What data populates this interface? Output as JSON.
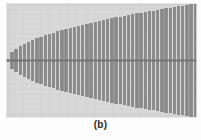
{
  "figure": {
    "caption": "(b)",
    "panel": {
      "width": 191,
      "height": 115,
      "background_color": "#d9d9d9",
      "stripe_dark_color": "#8a8a8a",
      "stripe_light_color": "#c9c9c9",
      "centerline_color": "#6e6e6e"
    }
  },
  "chart_data": {
    "type": "bar",
    "title": "",
    "subtitle": "",
    "xlabel": "",
    "ylabel": "",
    "grid": false,
    "legend": null,
    "annotations": [
      {
        "kind": "centerline",
        "orientation": "horizontal",
        "y": 0,
        "color": "#6e6e6e",
        "thickness_px": 2
      }
    ],
    "envelope": {
      "shape": "parabolic",
      "symmetric_about_y": 0,
      "apex_x": 0.0,
      "apex_half_height": 0.02,
      "max_half_height": 1.0
    },
    "xlim": [
      0,
      1
    ],
    "ylim": [
      -1,
      1
    ],
    "bar_count": 46,
    "bar_width_fraction": 0.52,
    "categories": [
      0.0,
      0.0222,
      0.0444,
      0.0667,
      0.0889,
      0.1111,
      0.1333,
      0.1556,
      0.1778,
      0.2,
      0.2222,
      0.2444,
      0.2667,
      0.2889,
      0.3111,
      0.3333,
      0.3556,
      0.3778,
      0.4,
      0.4222,
      0.4444,
      0.4667,
      0.4889,
      0.5111,
      0.5333,
      0.5556,
      0.5778,
      0.6,
      0.6222,
      0.6444,
      0.6667,
      0.6889,
      0.7111,
      0.7333,
      0.7556,
      0.7778,
      0.8,
      0.8222,
      0.8444,
      0.8667,
      0.8889,
      0.9111,
      0.9333,
      0.9556,
      0.9778,
      1.0
    ],
    "series": [
      {
        "name": "half-height",
        "values": [
          0.03,
          0.149,
          0.211,
          0.258,
          0.298,
          0.333,
          0.365,
          0.394,
          0.422,
          0.447,
          0.471,
          0.494,
          0.516,
          0.537,
          0.558,
          0.577,
          0.596,
          0.615,
          0.632,
          0.65,
          0.667,
          0.683,
          0.699,
          0.715,
          0.73,
          0.745,
          0.76,
          0.775,
          0.789,
          0.803,
          0.816,
          0.83,
          0.843,
          0.856,
          0.869,
          0.882,
          0.894,
          0.907,
          0.919,
          0.931,
          0.943,
          0.954,
          0.966,
          0.978,
          0.989,
          1.0
        ]
      }
    ]
  }
}
